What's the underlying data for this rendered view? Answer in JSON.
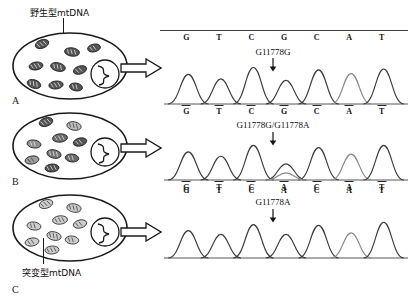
{
  "figure": {
    "title_wild": "野生型mtDNA",
    "title_mutant": "突变型mtDNA",
    "wild_label_cn": "野生型",
    "wild_label_lat": "mtDNA",
    "mutant_label_cn": "突变型",
    "mutant_label_lat": "mtDNA",
    "colors": {
      "outline": "#1a1a1a",
      "trace_dark": "#3c3c3c",
      "trace_light": "#8a8a8a",
      "baseline": "#2b2b2b",
      "text": "#111111",
      "mito_wild_fill": "#4a4a4a",
      "mito_mutant_fill": "#cfcfcf",
      "mito_mixed_fill": "#9a9a9a"
    }
  },
  "cells": [
    {
      "id": "A",
      "letter": "A",
      "caption": "野生型mtDNA",
      "mito_type": "wild",
      "mito_count": 9
    },
    {
      "id": "B",
      "letter": "B",
      "caption": "",
      "mito_type": "mixed",
      "mito_count": 9
    },
    {
      "id": "C",
      "letter": "C",
      "caption": "突变型mtDNA",
      "mito_type": "mutant",
      "mito_count": 9
    }
  ],
  "arrows": [
    {
      "name": "arrow-a",
      "points_to": "panel-a"
    },
    {
      "name": "arrow-b",
      "points_to": "panel-b"
    },
    {
      "name": "arrow-c",
      "points_to": "panel-c"
    }
  ],
  "chart_data": {
    "type": "line",
    "xlabel": "",
    "ylabel": "",
    "grid": false,
    "legend": "none",
    "panels": [
      {
        "id": "panel-a",
        "cell": "A",
        "annotation": "G11778G",
        "annotation_index": 3,
        "genotype": "homoplasmic wild type",
        "top_sequence": [
          "G",
          "T",
          "C",
          "G",
          "C",
          "A",
          "T"
        ],
        "bottom_sequence": [
          "G",
          "T",
          "C",
          "G",
          "C",
          "A",
          "T"
        ],
        "peaks": [
          {
            "base": "G",
            "height": 0.78,
            "shade": "dark"
          },
          {
            "base": "T",
            "height": 0.66,
            "shade": "dark"
          },
          {
            "base": "C",
            "height": 0.96,
            "shade": "dark"
          },
          {
            "base": "G",
            "height": 0.62,
            "shade": "dark"
          },
          {
            "base": "C",
            "height": 0.9,
            "shade": "dark"
          },
          {
            "base": "A",
            "height": 0.8,
            "shade": "light"
          },
          {
            "base": "T",
            "height": 0.92,
            "shade": "dark"
          }
        ],
        "secondary_peaks": []
      },
      {
        "id": "panel-b",
        "cell": "B",
        "annotation": "G11778G/G11778A",
        "annotation_index": 3,
        "genotype": "heteroplasmic",
        "top_sequence": [
          "G",
          "T",
          "C",
          "G",
          "C",
          "A",
          "T"
        ],
        "bottom_sequence": [
          "G",
          "T",
          "C",
          "A",
          "C",
          "A",
          "T"
        ],
        "peaks": [
          {
            "base": "G",
            "height": 0.78,
            "shade": "dark"
          },
          {
            "base": "T",
            "height": 0.66,
            "shade": "dark"
          },
          {
            "base": "C",
            "height": 0.96,
            "shade": "dark"
          },
          {
            "base": "G",
            "height": 0.45,
            "shade": "dark"
          },
          {
            "base": "C",
            "height": 0.9,
            "shade": "dark"
          },
          {
            "base": "A",
            "height": 0.72,
            "shade": "light"
          },
          {
            "base": "T",
            "height": 0.96,
            "shade": "dark"
          }
        ],
        "secondary_peaks": [
          {
            "index": 3,
            "base": "A",
            "height": 0.2,
            "shade": "light"
          }
        ]
      },
      {
        "id": "panel-c",
        "cell": "C",
        "annotation": "G11778A",
        "annotation_index": 3,
        "genotype": "homoplasmic mutant",
        "top_sequence": [
          "G",
          "T",
          "C",
          "A",
          "C",
          "A",
          "T"
        ],
        "bottom_sequence": [],
        "peaks": [
          {
            "base": "G",
            "height": 0.72,
            "shade": "dark"
          },
          {
            "base": "T",
            "height": 0.62,
            "shade": "dark"
          },
          {
            "base": "C",
            "height": 0.88,
            "shade": "dark"
          },
          {
            "base": "A",
            "height": 0.62,
            "shade": "dark"
          },
          {
            "base": "C",
            "height": 0.86,
            "shade": "dark"
          },
          {
            "base": "A",
            "height": 0.66,
            "shade": "light"
          },
          {
            "base": "T",
            "height": 0.94,
            "shade": "dark"
          }
        ],
        "secondary_peaks": []
      }
    ]
  }
}
